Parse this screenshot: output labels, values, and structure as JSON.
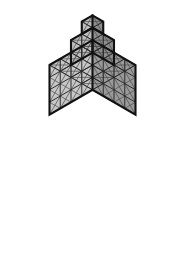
{
  "figure": {
    "background_color": "#ffffff",
    "projection": "isometric",
    "unit_cell_width_px": 21.5,
    "unit_cell_height_px": 12.4,
    "apex_x_px": 92.5,
    "apex_y_px": 3.0
  },
  "palette": {
    "face_top": "#e9e9e9",
    "face_left": "#9a9a9a",
    "face_right": "#c6c6c6",
    "face_top_upper": "#dcdcdc",
    "face_left_upper": "#8d8d8d",
    "face_right_upper": "#bdbdbd",
    "grid_thin": "#4a4a4a",
    "grid_cell": "#2a2a2a",
    "outline": "#111111"
  },
  "structure": {
    "tiers": [
      {
        "name": "base-tier",
        "size": 4,
        "cubes": 64,
        "height_units": 4,
        "origin_y_units": 0
      },
      {
        "name": "middle-tier",
        "size": 2,
        "cubes": 8,
        "height_units": 2,
        "origin_y_units": 4
      },
      {
        "name": "top-tier",
        "size": 1,
        "cubes": 1,
        "height_units": 1,
        "origin_y_units": 6
      }
    ],
    "total_cubes": 73,
    "total_height_units": 7
  }
}
